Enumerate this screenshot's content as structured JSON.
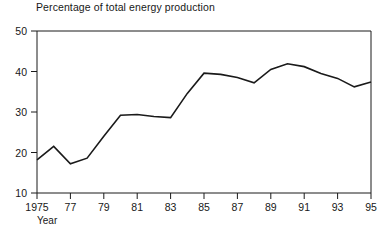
{
  "chart_data": {
    "type": "line",
    "title": "Percentage of total energy production",
    "xlabel": "Year",
    "ylabel": "",
    "xlim": [
      1975,
      1995
    ],
    "ylim": [
      10,
      50
    ],
    "grid": false,
    "legend": null,
    "x_tick_labels": [
      "1975",
      "77",
      "79",
      "81",
      "83",
      "85",
      "87",
      "89",
      "91",
      "93",
      "95"
    ],
    "x_ticks": [
      1975,
      1977,
      1979,
      1981,
      1983,
      1985,
      1987,
      1989,
      1991,
      1993,
      1995
    ],
    "y_tick_labels": [
      "10",
      "20",
      "30",
      "40",
      "50"
    ],
    "y_ticks": [
      10,
      20,
      30,
      40,
      50
    ],
    "x": [
      1975,
      1976,
      1977,
      1978,
      1979,
      1980,
      1981,
      1982,
      1983,
      1984,
      1985,
      1986,
      1987,
      1988,
      1989,
      1990,
      1991,
      1992,
      1993,
      1994,
      1995
    ],
    "values": [
      18.2,
      21.5,
      17.2,
      18.6,
      24.0,
      29.2,
      29.4,
      28.9,
      28.6,
      34.6,
      39.6,
      39.3,
      38.5,
      37.2,
      40.5,
      41.9,
      41.2,
      39.5,
      38.3,
      36.2,
      37.4
    ],
    "series": [
      {
        "name": "Percentage of total energy production",
        "color": "#1a1a1a",
        "values": [
          18.2,
          21.5,
          17.2,
          18.6,
          24.0,
          29.2,
          29.4,
          28.9,
          28.6,
          34.6,
          39.6,
          39.3,
          38.5,
          37.2,
          40.5,
          41.9,
          41.2,
          39.5,
          38.3,
          36.2,
          37.4
        ]
      }
    ]
  },
  "axes": {
    "x_axis_name": "Year"
  }
}
